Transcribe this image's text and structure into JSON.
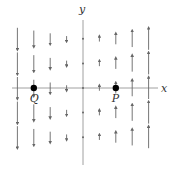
{
  "figure": {
    "type": "vector-field",
    "axes": {
      "x_label": "x",
      "y_label": "y",
      "origin_px": [
        83,
        88
      ],
      "spacing_px": [
        16.4,
        24.6
      ]
    },
    "columns": [
      -4,
      -3,
      -2,
      -1,
      0,
      1,
      2,
      3,
      4
    ],
    "rows": [
      2,
      1,
      0,
      -1,
      -2
    ],
    "field_description": "vertical vectors, magnitude proportional to x; pointing down for x<0, up for x>0",
    "points": [
      {
        "label": "Q",
        "x": -3,
        "y": 0
      },
      {
        "label": "P",
        "x": 2,
        "y": 0
      }
    ],
    "colors": {
      "axis": "#777777",
      "arrow": "#666666",
      "point": "#000000"
    }
  }
}
